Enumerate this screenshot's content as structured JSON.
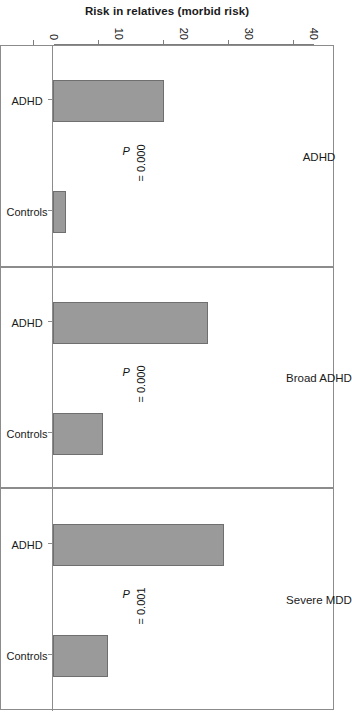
{
  "chart_data": {
    "type": "bar",
    "title": "",
    "orientation": "vertical-bars-in-rotated-figure",
    "xlabel": "",
    "ylabel": "Risk in relatives (morbid risk)",
    "ylim": [
      0,
      40
    ],
    "yticks": [
      0,
      10,
      20,
      30,
      40
    ],
    "ytick_labels": [
      "0",
      "10",
      "20",
      "30",
      "40"
    ],
    "grid": false,
    "legend": "none",
    "categories": [
      "ADHD",
      "Controls"
    ],
    "panels": [
      {
        "label": "ADHD",
        "annotation": "P = 0.000",
        "annotation_prefix": "P",
        "annotation_rest": " = 0.000",
        "bars": [
          {
            "category": "ADHD",
            "value": 17.1
          },
          {
            "category": "Controls",
            "value": 2.0
          }
        ]
      },
      {
        "label": "Broad ADHD",
        "annotation": "P = 0.000",
        "annotation_prefix": "P",
        "annotation_rest": " = 0.000",
        "bars": [
          {
            "category": "ADHD",
            "value": 23.8
          },
          {
            "category": "Controls",
            "value": 7.7
          }
        ]
      },
      {
        "label": "Severe MDD",
        "annotation": "P = 0.001",
        "annotation_prefix": "P",
        "annotation_rest": " = 0.001",
        "bars": [
          {
            "category": "ADHD",
            "value": 26.3
          },
          {
            "category": "Controls",
            "value": 8.5
          }
        ]
      }
    ],
    "colors": {
      "bar_fill": "#9a9a9a",
      "bar_stroke": "#6f6f6f",
      "axis": "#8c8c8c",
      "text": "#1a1a1a",
      "background": "#ffffff"
    }
  }
}
